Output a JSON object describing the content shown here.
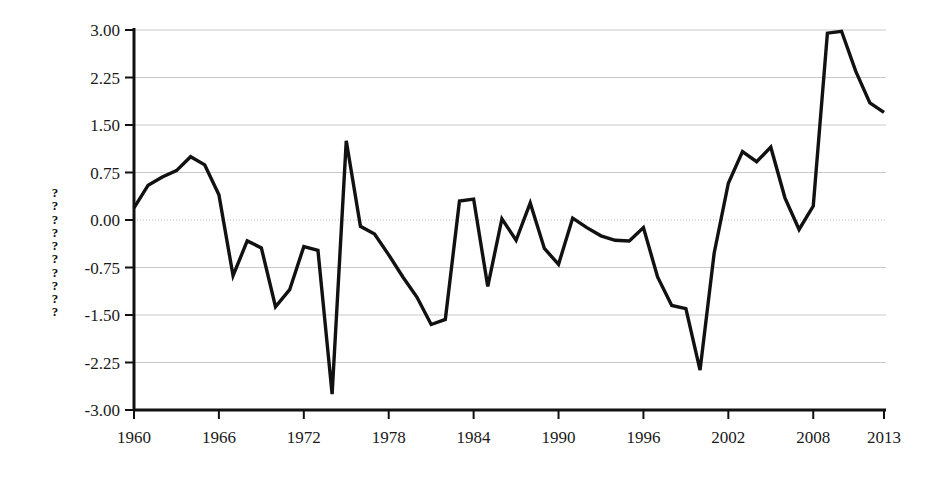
{
  "chart_data": {
    "type": "line",
    "title": "",
    "xlabel": "",
    "ylabel": "??????????",
    "ylabel_chars": [
      "?",
      "?",
      "?",
      "?",
      "?",
      "?",
      "?",
      "?",
      "?",
      "?"
    ],
    "xlim": [
      1960,
      2013
    ],
    "ylim": [
      -3.0,
      3.0
    ],
    "grid": true,
    "legend": null,
    "line_color": "#111111",
    "grid_color": "#c9c9c9",
    "y_ticks": [
      "3.00",
      "2.25",
      "1.50",
      "0.75",
      "0.00",
      "-0.75",
      "-1.50",
      "-2.25",
      "-3.00"
    ],
    "y_tick_values": [
      3.0,
      2.25,
      1.5,
      0.75,
      0.0,
      -0.75,
      -1.5,
      -2.25,
      -3.0
    ],
    "x_ticks": [
      "1960",
      "1966",
      "1972",
      "1978",
      "1984",
      "1990",
      "1996",
      "2002",
      "2008",
      "2013"
    ],
    "x_tick_values": [
      1960,
      1966,
      1972,
      1978,
      1984,
      1990,
      1996,
      2002,
      2008,
      2013
    ],
    "x": [
      1960,
      1961,
      1962,
      1963,
      1964,
      1965,
      1966,
      1967,
      1968,
      1969,
      1970,
      1971,
      1972,
      1973,
      1974,
      1975,
      1976,
      1977,
      1978,
      1979,
      1980,
      1981,
      1982,
      1983,
      1984,
      1985,
      1986,
      1987,
      1988,
      1989,
      1990,
      1991,
      1992,
      1993,
      1994,
      1995,
      1996,
      1997,
      1998,
      1999,
      2000,
      2001,
      2002,
      2003,
      2004,
      2005,
      2006,
      2007,
      2008,
      2009,
      2010,
      2011,
      2012,
      2013
    ],
    "values": [
      0.19,
      0.55,
      0.68,
      0.78,
      1.0,
      0.87,
      0.4,
      -0.88,
      -0.33,
      -0.44,
      -1.37,
      -1.1,
      -0.42,
      -0.48,
      -2.75,
      1.25,
      -0.1,
      -0.22,
      -0.55,
      -0.9,
      -1.22,
      -1.65,
      -1.57,
      0.3,
      0.33,
      -1.05,
      0.02,
      -0.32,
      0.27,
      -0.45,
      -0.7,
      0.03,
      -0.12,
      -0.25,
      -0.32,
      -0.33,
      -0.12,
      -0.9,
      -1.35,
      -1.4,
      -2.37,
      -0.52,
      0.58,
      1.08,
      0.92,
      1.15,
      0.35,
      -0.15,
      0.22,
      2.95,
      2.98,
      2.35,
      1.85,
      1.7
    ],
    "series_name": "series-1"
  }
}
